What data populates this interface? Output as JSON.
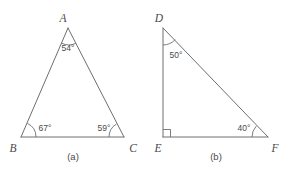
{
  "figure": {
    "background_color": "#ffffff",
    "stroke_color": "#6e6e6e",
    "text_color": "#4a4a4a",
    "panels": [
      {
        "id": "panel-a",
        "caption": "(a)",
        "shape": "triangle",
        "vertices": [
          {
            "name": "A",
            "label": "A",
            "x": 68,
            "y": 28
          },
          {
            "name": "B",
            "label": "B",
            "x": 21,
            "y": 137
          },
          {
            "name": "C",
            "label": "C",
            "x": 124,
            "y": 137
          }
        ],
        "angles": [
          {
            "at": "A",
            "label": "54°",
            "value": 54
          },
          {
            "at": "B",
            "label": "67°",
            "value": 67
          },
          {
            "at": "C",
            "label": "59°",
            "value": 59
          }
        ]
      },
      {
        "id": "panel-b",
        "caption": "(b)",
        "shape": "right-triangle",
        "vertices": [
          {
            "name": "D",
            "label": "D",
            "x": 163,
            "y": 28
          },
          {
            "name": "E",
            "label": "E",
            "x": 163,
            "y": 137
          },
          {
            "name": "F",
            "label": "F",
            "x": 268,
            "y": 137
          }
        ],
        "angles": [
          {
            "at": "D",
            "label": "50°",
            "value": 50
          },
          {
            "at": "E",
            "label": "",
            "value": 90,
            "marker": "right-angle-square"
          },
          {
            "at": "F",
            "label": "40°",
            "value": 40
          }
        ]
      }
    ]
  },
  "labels": {
    "a_vertex": "A",
    "b_vertex": "B",
    "c_vertex": "C",
    "d_vertex": "D",
    "e_vertex": "E",
    "f_vertex": "F",
    "angle_a": "54°",
    "angle_b": "67°",
    "angle_c": "59°",
    "angle_d": "50°",
    "angle_f": "40°",
    "caption_a": "(a)",
    "caption_b": "(b)"
  }
}
